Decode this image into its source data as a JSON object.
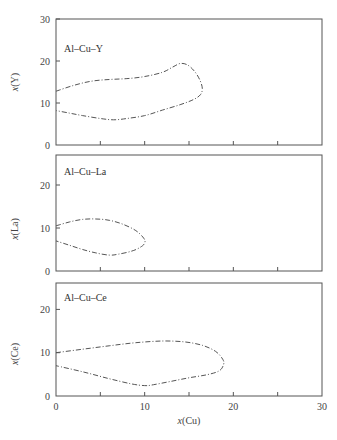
{
  "chart_data": [
    {
      "type": "line",
      "title": "Al-Cu-Y",
      "xlabel": "",
      "ylabel": "x(Y)",
      "xlim": [
        0,
        30
      ],
      "ylim": [
        0,
        30
      ],
      "yticks": [
        0,
        10,
        20,
        30
      ],
      "xticks": [
        0,
        5,
        10,
        15,
        20,
        25,
        30
      ],
      "series": [
        {
          "name": "glass-forming region boundary",
          "points": [
            [
              0,
              12.8
            ],
            [
              2,
              14.2
            ],
            [
              4,
              15.2
            ],
            [
              6,
              15.6
            ],
            [
              8,
              15.8
            ],
            [
              10,
              16.3
            ],
            [
              12,
              17.3
            ],
            [
              13.2,
              18.6
            ],
            [
              14,
              19.4
            ],
            [
              14.8,
              19.1
            ],
            [
              15.6,
              17.6
            ],
            [
              16.2,
              15.6
            ],
            [
              16.5,
              13.5
            ],
            [
              16.3,
              12
            ],
            [
              15.5,
              10.8
            ],
            [
              14,
              9.6
            ],
            [
              12,
              8.3
            ],
            [
              10,
              7
            ],
            [
              8,
              6.3
            ],
            [
              6.5,
              6
            ],
            [
              5,
              6.3
            ],
            [
              3,
              7
            ],
            [
              1.5,
              7.6
            ],
            [
              0,
              8.2
            ]
          ]
        }
      ]
    },
    {
      "type": "line",
      "title": "Al-Cu-La",
      "xlabel": "",
      "ylabel": "x(La)",
      "xlim": [
        0,
        30
      ],
      "ylim": [
        0,
        27
      ],
      "yticks": [
        0,
        10,
        20
      ],
      "xticks": [
        0,
        5,
        10,
        15,
        20,
        25,
        30
      ],
      "series": [
        {
          "name": "glass-forming region boundary",
          "points": [
            [
              0,
              10.5
            ],
            [
              1.5,
              11.4
            ],
            [
              3,
              12
            ],
            [
              4.5,
              12.1
            ],
            [
              6,
              11.8
            ],
            [
              7.5,
              10.9
            ],
            [
              9,
              9.4
            ],
            [
              9.9,
              7.6
            ],
            [
              10,
              6.5
            ],
            [
              9.5,
              5.5
            ],
            [
              8.5,
              4.6
            ],
            [
              7,
              3.9
            ],
            [
              6,
              3.7
            ],
            [
              4.5,
              4.2
            ],
            [
              3,
              5
            ],
            [
              1.5,
              6
            ],
            [
              0,
              7
            ]
          ]
        }
      ]
    },
    {
      "type": "line",
      "title": "Al-Cu-Ce",
      "xlabel": "x(Cu)",
      "ylabel": "x(Ce)",
      "xlim": [
        0,
        30
      ],
      "ylim": [
        0,
        26
      ],
      "yticks": [
        0,
        10,
        20
      ],
      "xticks": [
        0,
        5,
        10,
        15,
        20,
        25,
        30
      ],
      "xticklabels": [
        "0",
        "10",
        "20",
        "30"
      ],
      "series": [
        {
          "name": "glass-forming region boundary",
          "points": [
            [
              0,
              10
            ],
            [
              3,
              10.8
            ],
            [
              6,
              11.6
            ],
            [
              9,
              12.3
            ],
            [
              12,
              12.7
            ],
            [
              14.5,
              12.5
            ],
            [
              16.5,
              11.7
            ],
            [
              18,
              10.3
            ],
            [
              18.8,
              8.5
            ],
            [
              18.9,
              7.3
            ],
            [
              18.4,
              5.8
            ],
            [
              17,
              4.9
            ],
            [
              15,
              4.2
            ],
            [
              13,
              3.4
            ],
            [
              11,
              2.6
            ],
            [
              10,
              2.4
            ],
            [
              8.5,
              2.8
            ],
            [
              6,
              4
            ],
            [
              3,
              5.6
            ],
            [
              0,
              7
            ]
          ]
        }
      ]
    }
  ],
  "panels": [
    {
      "label": "Al–Cu–Y",
      "ylabel": "x(Y)",
      "yticklabels": [
        "0",
        "10",
        "20",
        "30"
      ]
    },
    {
      "label": "Al–Cu–La",
      "ylabel": "x(La)",
      "yticklabels": [
        "0",
        "10",
        "20"
      ]
    },
    {
      "label": "Al–Cu–Ce",
      "ylabel": "x(Ce)",
      "yticklabels": [
        "0",
        "10",
        "20"
      ]
    }
  ],
  "xaxis": {
    "label": "x(Cu)",
    "ticklabels": [
      "0",
      "10",
      "20",
      "30"
    ]
  }
}
